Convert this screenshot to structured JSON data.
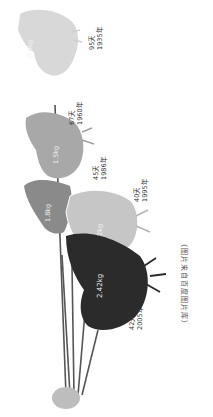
{
  "entries": [
    {
      "weight": "0.9kg",
      "days": "95天",
      "year": "1935年",
      "color": "#d2d2d2"
    },
    {
      "weight": "1.5kg",
      "days": "67天",
      "year": "1960年",
      "color": "#a6a6a6"
    },
    {
      "weight": "1.8kg",
      "days": "45天",
      "year": "1986年",
      "color": "#8a8a8a"
    },
    {
      "weight": "2kg",
      "days": "40天",
      "year": "1995年",
      "color": "#c4c4c4"
    },
    {
      "weight": "2.42kg",
      "days": "42天",
      "year": "2005年",
      "color": "#2a2a2a"
    }
  ],
  "chick": {
    "color": "#bdbdbd"
  },
  "caption": "（图片来自百度图片库）"
}
